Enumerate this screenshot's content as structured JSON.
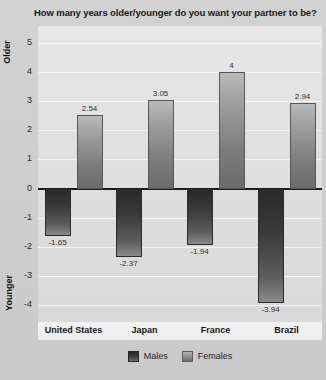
{
  "chart_data": {
    "type": "bar",
    "title": "How many years older/younger do you want your partner to be?",
    "xlabel": "",
    "ylabel": "",
    "axis_top_label": "Older",
    "axis_bottom_label": "Younger",
    "categories": [
      "United States",
      "Japan",
      "France",
      "Brazil"
    ],
    "series": [
      {
        "name": "Males",
        "values": [
          -1.65,
          -2.37,
          -1.94,
          -3.94
        ],
        "color": "#3a3a3a"
      },
      {
        "name": "Females",
        "values": [
          2.54,
          3.05,
          4,
          2.94
        ],
        "color": "#8d8d8d"
      }
    ],
    "value_labels": {
      "males": [
        "-1.65",
        "-2.37",
        "-1.94",
        "-3.94"
      ],
      "females": [
        "2.54",
        "3.05",
        "4",
        "2.94"
      ]
    },
    "ylim": [
      -4.6,
      5.6
    ],
    "yticks": [
      5,
      4,
      3,
      2,
      1,
      0,
      -1,
      -2,
      -3,
      -4
    ],
    "ytick_labels": [
      "5",
      "4",
      "3",
      "2",
      "1",
      "0",
      "-1",
      "-2",
      "-3",
      "-4"
    ],
    "grid": true,
    "legend_position": "bottom",
    "legend": [
      "Males",
      "Females"
    ]
  },
  "colors": {
    "background": "#cfcfcf",
    "plot_background": "#e2e2e2",
    "gridline": "#f4f4f4",
    "zeroline": "#1c1c1c",
    "males": "#3a3a3a",
    "females": "#8d8d8d",
    "text": "#1b1b1b"
  }
}
